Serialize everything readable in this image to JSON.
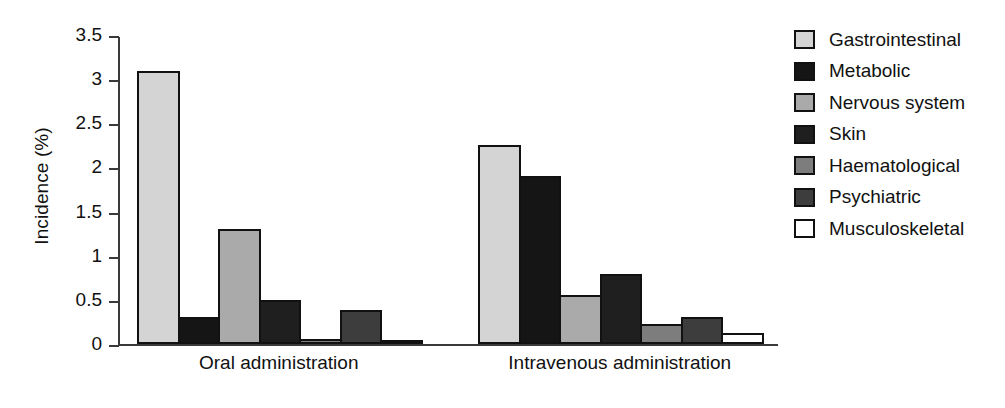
{
  "chart_data": {
    "type": "bar",
    "title": "",
    "xlabel": "",
    "ylabel": "Incidence (%)",
    "ylim": [
      0,
      3.5
    ],
    "yticks": [
      "0",
      "0.5",
      "1",
      "1.5",
      "2",
      "2.5",
      "3",
      "3.5"
    ],
    "ytick_values": [
      0,
      0.5,
      1,
      1.5,
      2,
      2.5,
      3,
      3.5
    ],
    "grid": false,
    "legend_position": "right",
    "categories": [
      "Oral administration",
      "Intravenous administration"
    ],
    "series": [
      {
        "name": "Gastrointestinal",
        "color": "#d4d4d4",
        "values": [
          3.09,
          2.25
        ]
      },
      {
        "name": "Metabolic",
        "color": "#151515",
        "values": [
          0.31,
          1.9
        ]
      },
      {
        "name": "Nervous system",
        "color": "#aaaaaa",
        "values": [
          1.3,
          0.56
        ]
      },
      {
        "name": "Skin",
        "color": "#1f1f1f",
        "values": [
          0.5,
          0.79
        ]
      },
      {
        "name": "Haematological",
        "color": "#7d7d7d",
        "values": [
          0.06,
          0.23
        ]
      },
      {
        "name": "Psychiatric",
        "color": "#3d3d3d",
        "values": [
          0.38,
          0.31
        ]
      },
      {
        "name": "Musculoskeletal",
        "color": "#ffffff",
        "values": [
          0.05,
          0.13
        ]
      }
    ]
  },
  "axis": {
    "y_title": "Incidence (%)"
  },
  "legend": {
    "items": [
      {
        "label": "Gastrointestinal"
      },
      {
        "label": "Metabolic"
      },
      {
        "label": "Nervous system"
      },
      {
        "label": "Skin"
      },
      {
        "label": "Haematological"
      },
      {
        "label": "Psychiatric"
      },
      {
        "label": "Musculoskeletal"
      }
    ]
  }
}
